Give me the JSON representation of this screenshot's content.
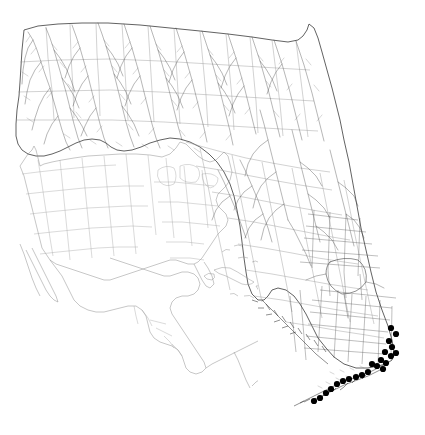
{
  "figure": {
    "type": "species-distribution-map",
    "region": "Florida, USA",
    "background_color": "#ffffff",
    "width": 425,
    "height": 435,
    "title": "",
    "caption": "",
    "legend": ""
  },
  "main_map": {
    "name": "florida-state-map",
    "outline_color": "#3a3a3a",
    "county_boundary_color": "#9a9a9a",
    "hydrography_color": "#4a4a4a",
    "shows_counties": true,
    "shows_hydrography": true,
    "shows_canals": true
  },
  "inset_map": {
    "name": "north-america-inset",
    "extent": "North America, Central America, Caribbean, northern South America",
    "line_color": "#8e8e8e",
    "shows_us_states": true,
    "position": "lower-left"
  },
  "occurrence_points": {
    "marker_shape": "filled-circle",
    "marker_color": "#000000",
    "marker_radius": 3.1,
    "count": 22,
    "clusters": [
      "Southeast Atlantic coast (Palm Beach - Broward - Miami-Dade)",
      "Upper Florida Keys",
      "Middle Florida Keys",
      "Lower Florida Keys / Key West"
    ],
    "points": [
      {
        "x": 391,
        "y": 328
      },
      {
        "x": 396,
        "y": 334
      },
      {
        "x": 389,
        "y": 341
      },
      {
        "x": 392,
        "y": 347
      },
      {
        "x": 385,
        "y": 352
      },
      {
        "x": 391,
        "y": 356
      },
      {
        "x": 396,
        "y": 353
      },
      {
        "x": 381,
        "y": 360
      },
      {
        "x": 386,
        "y": 363
      },
      {
        "x": 377,
        "y": 366
      },
      {
        "x": 372,
        "y": 364
      },
      {
        "x": 383,
        "y": 369
      },
      {
        "x": 368,
        "y": 372
      },
      {
        "x": 362,
        "y": 375
      },
      {
        "x": 356,
        "y": 377
      },
      {
        "x": 349,
        "y": 379
      },
      {
        "x": 343,
        "y": 381
      },
      {
        "x": 337,
        "y": 384
      },
      {
        "x": 331,
        "y": 389
      },
      {
        "x": 326,
        "y": 393
      },
      {
        "x": 320,
        "y": 398
      },
      {
        "x": 314,
        "y": 401
      }
    ]
  }
}
